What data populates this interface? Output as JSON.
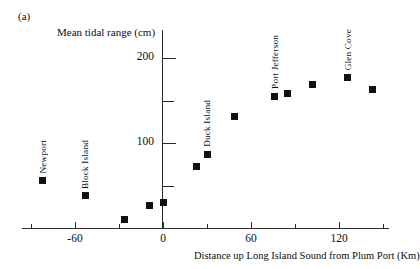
{
  "figure": {
    "panel_label": "(a)",
    "y_axis_title": "Mean tidal range (cm)",
    "x_axis_title": "Distance up Long Island Sound from Plum Port (Km)"
  },
  "chart_data": {
    "type": "scatter",
    "title": "(a)",
    "xlabel": "Distance up Long Island Sound from Plum Port (Km)",
    "ylabel": "Mean tidal range (cm)",
    "xlim": [
      -95,
      155
    ],
    "ylim": [
      0,
      235
    ],
    "grid": false,
    "legend": "none",
    "x_major_ticks": [
      -60,
      0,
      60,
      120
    ],
    "x_minor_ticks": [
      -90,
      -30,
      30,
      90,
      150
    ],
    "y_major_ticks": [
      100,
      200
    ],
    "y_minor_ticks": [
      50,
      150,
      250
    ],
    "x_tick_labels": [
      "-60",
      "0",
      "60",
      "120"
    ],
    "y_tick_labels": [
      "100",
      "200"
    ],
    "marker": "filled-square",
    "marker_color": "#111111",
    "points": [
      {
        "x": -82,
        "y": 56,
        "label": "Newport",
        "label_pos": "above"
      },
      {
        "x": -53,
        "y": 38,
        "label": "Block Island",
        "label_pos": "above"
      },
      {
        "x": -26,
        "y": 10,
        "label": "",
        "label_pos": ""
      },
      {
        "x": -9,
        "y": 27,
        "label": "",
        "label_pos": ""
      },
      {
        "x": 0,
        "y": 30,
        "label": "",
        "label_pos": ""
      },
      {
        "x": 23,
        "y": 72,
        "label": "",
        "label_pos": ""
      },
      {
        "x": 30,
        "y": 87,
        "label": "Duck Island",
        "label_pos": "above"
      },
      {
        "x": 49,
        "y": 131,
        "label": "",
        "label_pos": ""
      },
      {
        "x": 76,
        "y": 155,
        "label": "Port Jefferson",
        "label_pos": "above"
      },
      {
        "x": 85,
        "y": 158,
        "label": "",
        "label_pos": ""
      },
      {
        "x": 102,
        "y": 169,
        "label": "",
        "label_pos": ""
      },
      {
        "x": 126,
        "y": 177,
        "label": "Glen Cove",
        "label_pos": "above"
      },
      {
        "x": 143,
        "y": 163,
        "label": "",
        "label_pos": ""
      }
    ]
  }
}
